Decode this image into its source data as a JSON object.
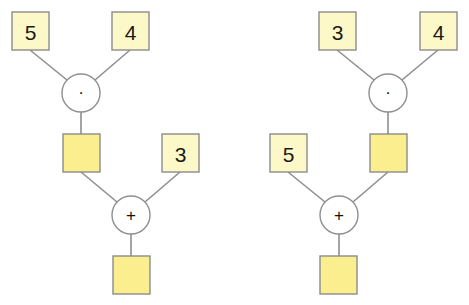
{
  "trees": [
    {
      "id": "left",
      "inputs_top": [
        "5",
        "4"
      ],
      "top_operator": "·",
      "top_result": "",
      "second_input": "3",
      "second_input_side": "right",
      "bottom_operator": "+",
      "final_result": ""
    },
    {
      "id": "right",
      "inputs_top": [
        "3",
        "4"
      ],
      "top_operator": "·",
      "top_result": "",
      "second_input": "5",
      "second_input_side": "left",
      "bottom_operator": "+",
      "final_result": ""
    }
  ],
  "colors": {
    "given_box_fill": "#fdf8c8",
    "empty_box_fill": "#fbee8e",
    "stroke": "#8c8c8c"
  }
}
